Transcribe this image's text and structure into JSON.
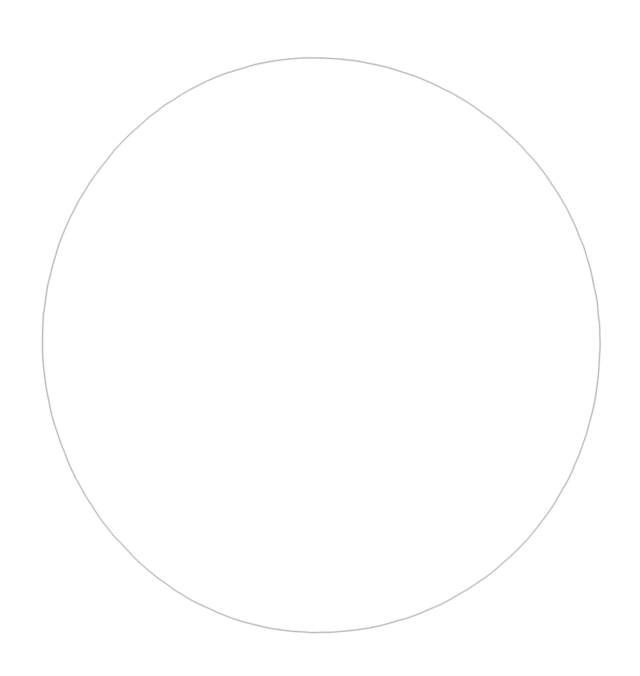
{
  "canvas": {
    "width": 640,
    "height": 676,
    "background_color": "#ffffff",
    "description": "blank white canvas containing a single hand-drawn circle outline"
  },
  "shapes": [
    {
      "id": "circle-outline",
      "kind": "circle",
      "label": "hand-drawn circle outline",
      "filled": false,
      "fill_color": "none",
      "stroke_color": "#b4b4bc",
      "halo_color": "#dcdce2",
      "stroke_width": 1,
      "center_x": 321,
      "center_y": 345,
      "radius_x": 278,
      "radius_y": 288,
      "bounds": {
        "left": 43,
        "top": 57,
        "right": 600,
        "bottom": 633
      },
      "style": "freehand sketch, slightly irregular, very light gray, thin single stroke"
    }
  ],
  "text_elements": [],
  "annotations": []
}
